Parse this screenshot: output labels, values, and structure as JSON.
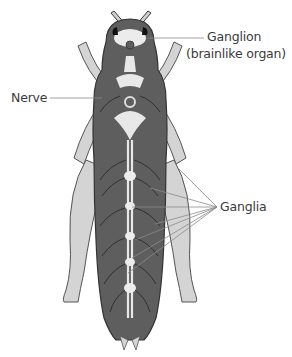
{
  "figure": {
    "top_caption_fragment": "",
    "colors": {
      "background": "#ffffff",
      "body_fill": "#5e5e5e",
      "limb_fill": "#d4d4d4",
      "outline": "#3a3a3a",
      "nerve_cord": "#e8e8e8",
      "leader_line": "#8a8a8a",
      "label_text": "#3a3a3a"
    }
  },
  "labels": {
    "ganglion_line1": "Ganglion",
    "ganglion_line2": "(brainlike organ)",
    "nerve": "Nerve",
    "ganglia": "Ganglia"
  },
  "leaders": {
    "ganglion": {
      "from": [
        204,
        38
      ],
      "to": [
        148,
        38
      ]
    },
    "nerve": {
      "from": [
        50,
        98
      ],
      "to": [
        102,
        98
      ]
    },
    "ganglia_origin": [
      217,
      207
    ],
    "ganglia_targets": [
      [
        178,
        168
      ],
      [
        150,
        188
      ],
      [
        132,
        207
      ],
      [
        155,
        224
      ],
      [
        135,
        240
      ],
      [
        132,
        258
      ],
      [
        128,
        273
      ]
    ]
  }
}
